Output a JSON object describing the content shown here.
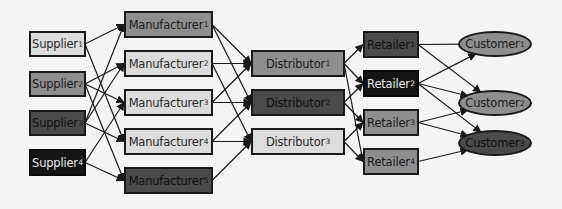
{
  "diagram": {
    "title": "",
    "colors": {
      "light": "#dcdcdc",
      "mid": "#8e8e8e",
      "dark": "#4a4a4a",
      "black": "#151515",
      "edge": "#1a1a1a",
      "background": "#f4f4f4"
    },
    "nodes": [
      {
        "id": "S1",
        "label": "Supplier",
        "sub": "1",
        "shape": "rect",
        "tone": "light",
        "x": 29,
        "y": 31,
        "w": 57,
        "h": 26
      },
      {
        "id": "S2",
        "label": "Supplier",
        "sub": "2",
        "shape": "rect",
        "tone": "mid",
        "x": 29,
        "y": 71,
        "w": 57,
        "h": 26
      },
      {
        "id": "S3",
        "label": "Supplier",
        "sub": "3",
        "shape": "rect",
        "tone": "dark",
        "x": 29,
        "y": 110,
        "w": 57,
        "h": 26
      },
      {
        "id": "S4",
        "label": "Supplier",
        "sub": "4",
        "shape": "rect",
        "tone": "black",
        "x": 29,
        "y": 149,
        "w": 57,
        "h": 27
      },
      {
        "id": "M1",
        "label": "Manufacturer",
        "sub": "1",
        "shape": "rect",
        "tone": "mid",
        "x": 124,
        "y": 11,
        "w": 89,
        "h": 27
      },
      {
        "id": "M2",
        "label": "Manufacturer",
        "sub": "2",
        "shape": "rect",
        "tone": "light",
        "x": 124,
        "y": 50,
        "w": 89,
        "h": 27
      },
      {
        "id": "M3",
        "label": "Manufacturer",
        "sub": "3",
        "shape": "rect",
        "tone": "light",
        "x": 124,
        "y": 89,
        "w": 89,
        "h": 27
      },
      {
        "id": "M4",
        "label": "Manufacturer",
        "sub": "4",
        "shape": "rect",
        "tone": "light",
        "x": 124,
        "y": 128,
        "w": 89,
        "h": 27
      },
      {
        "id": "M5",
        "label": "Manufacturer",
        "sub": "5",
        "shape": "rect",
        "tone": "dark",
        "x": 124,
        "y": 167,
        "w": 89,
        "h": 27
      },
      {
        "id": "D1",
        "label": "Distributor",
        "sub": "1",
        "shape": "rect",
        "tone": "mid",
        "x": 251,
        "y": 50,
        "w": 94,
        "h": 27
      },
      {
        "id": "D2",
        "label": "Distributor",
        "sub": "2",
        "shape": "rect",
        "tone": "dark",
        "x": 251,
        "y": 89,
        "w": 94,
        "h": 27
      },
      {
        "id": "D3",
        "label": "Distributor",
        "sub": "3",
        "shape": "rect",
        "tone": "light",
        "x": 251,
        "y": 128,
        "w": 94,
        "h": 27
      },
      {
        "id": "R1",
        "label": "Retailer",
        "sub": "1",
        "shape": "rect",
        "tone": "dark",
        "x": 363,
        "y": 31,
        "w": 56,
        "h": 27
      },
      {
        "id": "R2",
        "label": "Retailer",
        "sub": "2",
        "shape": "rect",
        "tone": "black",
        "x": 363,
        "y": 70,
        "w": 56,
        "h": 27
      },
      {
        "id": "R3",
        "label": "Retailer",
        "sub": "3",
        "shape": "rect",
        "tone": "mid",
        "x": 363,
        "y": 109,
        "w": 56,
        "h": 27
      },
      {
        "id": "R4",
        "label": "Retailer",
        "sub": "4",
        "shape": "rect",
        "tone": "mid",
        "x": 363,
        "y": 148,
        "w": 56,
        "h": 27
      },
      {
        "id": "C1",
        "label": "Customer",
        "sub": "1",
        "shape": "ellipse",
        "tone": "mid",
        "x": 458,
        "y": 31,
        "w": 74,
        "h": 26
      },
      {
        "id": "C2",
        "label": "Customer",
        "sub": "2",
        "shape": "ellipse",
        "tone": "mid",
        "x": 458,
        "y": 90,
        "w": 74,
        "h": 26
      },
      {
        "id": "C3",
        "label": "Customer",
        "sub": "3",
        "shape": "ellipse",
        "tone": "dark",
        "x": 458,
        "y": 130,
        "w": 74,
        "h": 26
      }
    ],
    "edges": [
      [
        "S1",
        "M1"
      ],
      [
        "S1",
        "M4"
      ],
      [
        "S2",
        "M2"
      ],
      [
        "S2",
        "M3"
      ],
      [
        "S2",
        "M5"
      ],
      [
        "S3",
        "M1"
      ],
      [
        "S3",
        "M2"
      ],
      [
        "S3",
        "M4"
      ],
      [
        "S4",
        "M3"
      ],
      [
        "S4",
        "M5"
      ],
      [
        "M1",
        "D1"
      ],
      [
        "M1",
        "D2"
      ],
      [
        "M2",
        "D1"
      ],
      [
        "M2",
        "D3"
      ],
      [
        "M3",
        "D1"
      ],
      [
        "M3",
        "D2"
      ],
      [
        "M4",
        "D2"
      ],
      [
        "M4",
        "D3"
      ],
      [
        "M5",
        "D3"
      ],
      [
        "D1",
        "R1"
      ],
      [
        "D1",
        "R2"
      ],
      [
        "D1",
        "R4"
      ],
      [
        "D2",
        "R2"
      ],
      [
        "D2",
        "R3"
      ],
      [
        "D3",
        "R3"
      ],
      [
        "D3",
        "R4"
      ],
      [
        "R1",
        "C1"
      ],
      [
        "R1",
        "C2"
      ],
      [
        "R2",
        "C1"
      ],
      [
        "R2",
        "C2"
      ],
      [
        "R2",
        "C3"
      ],
      [
        "R3",
        "C2"
      ],
      [
        "R3",
        "C3"
      ],
      [
        "R4",
        "C3"
      ]
    ]
  }
}
